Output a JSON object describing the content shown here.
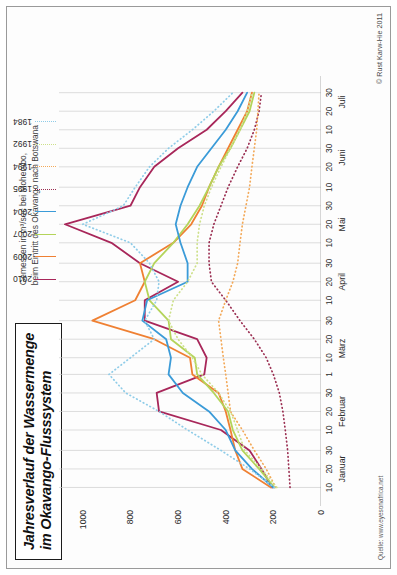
{
  "title": {
    "line1": "Jahresverlauf der Wassermenge",
    "line2": "im Okavango-Flusssystem"
  },
  "caption": {
    "line1": "Gemessen in m³/sec bei Mohembo,",
    "line2": "beim Eintritt des Okavango nach Botswana"
  },
  "copyright": "© Rust Karw-Hie 2011",
  "source": "Quelle: www.eyesonafrica.net",
  "legend": {
    "position": "top-right",
    "items": [
      {
        "label": "2010",
        "color": "#a8275a",
        "style": "solid"
      },
      {
        "label": "2009",
        "color": "#ef8033",
        "style": "solid"
      },
      {
        "label": "2007",
        "color": "#b4d45a",
        "style": "solid"
      },
      {
        "label": "2004",
        "color": "#3b9bd8",
        "style": "solid"
      },
      {
        "label": "1995",
        "color": "#9b2f52",
        "style": "dotted"
      },
      {
        "label": "1994",
        "color": "#f3a959",
        "style": "dotted"
      },
      {
        "label": "1992",
        "color": "#cde08a",
        "style": "dotted"
      },
      {
        "label": "1984",
        "color": "#8fcce8",
        "style": "dotted"
      }
    ]
  },
  "chart_data": {
    "type": "line",
    "title": "Jahresverlauf der Wassermenge im Okavango-Flusssystem",
    "subtitle": "Gemessen in m³/sec bei Mohembo, beim Eintritt des Okavango nach Botswana",
    "xlabel": "",
    "ylabel": "m³/sec",
    "ylim": [
      0,
      1100
    ],
    "yticks": [
      0,
      200,
      400,
      600,
      800,
      1000
    ],
    "ytick_labels": [
      "0",
      "200",
      "400",
      "600",
      "800",
      "1000"
    ],
    "grid": "vertical",
    "rotated_90": true,
    "months": [
      "Januar",
      "Februar",
      "März",
      "April",
      "Mai",
      "Juni",
      "Juli"
    ],
    "x_tick_labels": [
      "10",
      "20",
      "30",
      "10",
      "20",
      "30",
      "1",
      "10",
      "20",
      "30",
      "10",
      "20",
      "30",
      "10",
      "20",
      "30",
      "10",
      "20",
      "30",
      "10",
      "20",
      "30"
    ],
    "x": [
      10,
      20,
      30,
      41,
      51,
      61,
      71,
      80,
      90,
      100,
      111,
      121,
      131,
      142,
      152,
      162,
      172,
      183,
      193,
      203,
      213,
      223
    ],
    "series": [
      {
        "name": "2010",
        "color": "#a8275a",
        "style": "solid",
        "values": [
          205,
          250,
          300,
          420,
          680,
          690,
          490,
          480,
          520,
          740,
          740,
          600,
          760,
          880,
          1075,
          800,
          760,
          700,
          600,
          480,
          400,
          330
        ]
      },
      {
        "name": "2009",
        "color": "#ef8033",
        "style": "solid",
        "values": [
          210,
          330,
          360,
          380,
          400,
          430,
          540,
          550,
          700,
          960,
          780,
          740,
          760,
          620,
          545,
          500,
          470,
          430,
          390,
          350,
          310,
          290
        ]
      },
      {
        "name": "2007",
        "color": "#b4d45a",
        "style": "solid",
        "values": [
          195,
          260,
          330,
          370,
          390,
          450,
          520,
          530,
          630,
          640,
          720,
          740,
          700,
          620,
          560,
          510,
          470,
          430,
          380,
          340,
          300,
          280
        ]
      },
      {
        "name": "2004",
        "color": "#3b9bd8",
        "style": "solid",
        "values": [
          200,
          290,
          360,
          400,
          470,
          580,
          640,
          630,
          650,
          750,
          730,
          560,
          560,
          590,
          610,
          590,
          560,
          520,
          460,
          400,
          350,
          310
        ]
      },
      {
        "name": "1995",
        "color": "#9b2f52",
        "style": "dotted",
        "values": [
          130,
          135,
          140,
          150,
          160,
          175,
          200,
          230,
          280,
          340,
          400,
          460,
          470,
          470,
          450,
          420,
          390,
          350,
          310,
          280,
          260,
          250
        ]
      },
      {
        "name": "1994",
        "color": "#f3a959",
        "style": "dotted",
        "values": [
          190,
          230,
          280,
          330,
          380,
          390,
          400,
          410,
          420,
          430,
          400,
          370,
          350,
          340,
          330,
          315,
          300,
          290,
          280,
          270,
          265,
          260
        ]
      },
      {
        "name": "1992",
        "color": "#cde08a",
        "style": "dotted",
        "values": [
          185,
          250,
          320,
          350,
          380,
          430,
          500,
          540,
          600,
          640,
          620,
          560,
          520,
          520,
          510,
          490,
          460,
          420,
          380,
          340,
          310,
          290
        ]
      },
      {
        "name": "1984",
        "color": "#8fcce8",
        "style": "dotted",
        "values": [
          195,
          300,
          420,
          560,
          680,
          820,
          890,
          800,
          700,
          740,
          690,
          680,
          720,
          800,
          1000,
          830,
          780,
          720,
          640,
          540,
          450,
          370
        ]
      }
    ]
  }
}
